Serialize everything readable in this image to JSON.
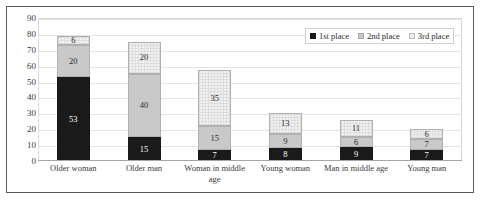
{
  "chart_data": {
    "type": "bar",
    "stacked": true,
    "title": "",
    "xlabel": "",
    "ylabel": "",
    "ylim": [
      0,
      90
    ],
    "ytick_step": 10,
    "yticks": [
      0,
      10,
      20,
      30,
      40,
      50,
      60,
      70,
      80,
      90
    ],
    "grid": true,
    "legend_position": "top-right",
    "categories": [
      "Older woman",
      "Older man",
      "Woman in middle age",
      "Young woman",
      "Man in middle age",
      "Young man"
    ],
    "series": [
      {
        "name": "1st place",
        "color": "#1a1a1a",
        "values": [
          53,
          15,
          7,
          8,
          9,
          7
        ]
      },
      {
        "name": "2nd place",
        "color": "#c9c9c9",
        "values": [
          20,
          40,
          15,
          9,
          6,
          7
        ]
      },
      {
        "name": "3rd place",
        "color": "#f0f0f0",
        "values": [
          6,
          20,
          35,
          13,
          11,
          6
        ]
      }
    ],
    "totals": [
      79,
      75,
      57,
      30,
      26,
      20
    ]
  },
  "legend": {
    "items": [
      {
        "label": "1st place",
        "swatch": "legend-swatch-black"
      },
      {
        "label": "2nd place",
        "swatch": "legend-swatch-gray"
      },
      {
        "label": "3rd place",
        "swatch": "legend-swatch-light"
      }
    ]
  },
  "axis": {
    "y_tick_labels": [
      "90",
      "80",
      "70",
      "60",
      "50",
      "40",
      "30",
      "20",
      "10",
      "0"
    ]
  }
}
